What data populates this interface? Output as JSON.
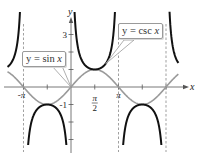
{
  "chart_data": {
    "type": "line",
    "title": "",
    "xlabel": "x",
    "ylabel": "y",
    "xlim": [
      -4.2,
      7.1
    ],
    "ylim": [
      -3.6,
      4.9
    ],
    "grid": false,
    "x_ticks": [
      {
        "value": -3.14159,
        "label": "-π"
      },
      {
        "value": -1.5708,
        "label": ""
      },
      {
        "value": 1.5708,
        "label": "π/2"
      },
      {
        "value": 3.14159,
        "label": "π"
      },
      {
        "value": 4.7124,
        "label": ""
      },
      {
        "value": 6.28318,
        "label": ""
      }
    ],
    "y_ticks": [
      {
        "value": 3,
        "label": "3"
      },
      {
        "value": 2,
        "label": ""
      },
      {
        "value": 1,
        "label": ""
      },
      {
        "value": -1,
        "label": "-1"
      },
      {
        "value": -2,
        "label": ""
      },
      {
        "value": -3,
        "label": ""
      }
    ],
    "series": [
      {
        "name": "y = sin x",
        "function": "sin",
        "color": "#9a9a9a",
        "style": "solid"
      },
      {
        "name": "y = csc x",
        "function": "csc",
        "color": "#111111",
        "style": "solid"
      }
    ],
    "asymptotes": [
      -3.14159,
      3.14159,
      6.28318
    ],
    "annotations": [
      {
        "text_prefix": "y = sin ",
        "text_var": "x",
        "points_to": [
          0,
          0
        ]
      },
      {
        "text_prefix": "y = csc ",
        "text_var": "x",
        "points_to": [
          2.3,
          1.33
        ]
      }
    ]
  },
  "layout": {
    "origin_px": [
      71,
      87
    ],
    "px_per_x_unit": 15.12,
    "px_per_y_unit": 17.5
  }
}
